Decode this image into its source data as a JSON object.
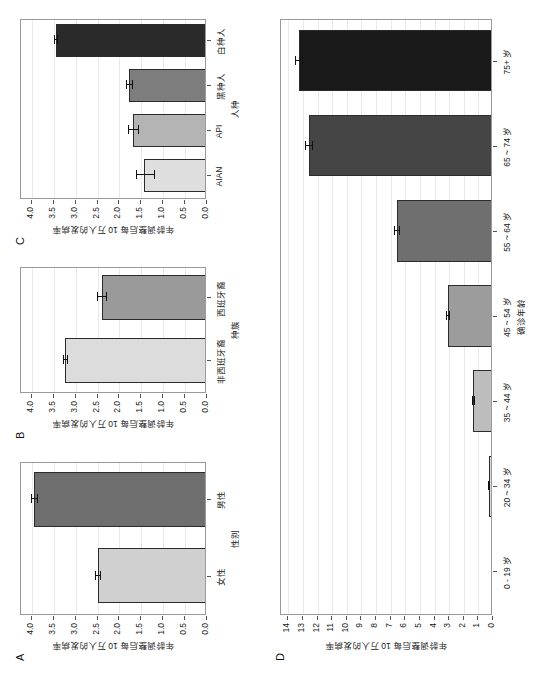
{
  "figure": {
    "axis_value_title": "年龄调整后每 10 万人的发病率",
    "panel_letters": {
      "a": "A",
      "b": "B",
      "c": "C",
      "d": "D"
    }
  },
  "chart_data": [
    {
      "id": "panel_a",
      "panel": "A",
      "type": "bar",
      "title": "",
      "xlabel": "性别",
      "ylabel": "年龄调整后每 10 万人的发病率",
      "categories": [
        "女性",
        "男性"
      ],
      "values": [
        2.5,
        3.95
      ],
      "err_low": [
        2.45,
        3.88
      ],
      "err_high": [
        2.56,
        4.02
      ],
      "bar_colors": [
        "#d0d0d0",
        "#6e6e6e"
      ],
      "yticks": [
        "0.0",
        "0.5",
        "1.0",
        "1.5",
        "2.0",
        "2.5",
        "3.0",
        "3.5",
        "4.0"
      ],
      "ylim": [
        0,
        4.25
      ],
      "grid": true
    },
    {
      "id": "panel_b",
      "panel": "B",
      "type": "bar",
      "title": "",
      "xlabel": "种族",
      "ylabel": "年龄调整后每 10 万人的发病率",
      "categories": [
        "非西班牙裔",
        "西班牙裔"
      ],
      "values": [
        3.25,
        2.4
      ],
      "err_low": [
        3.2,
        2.3
      ],
      "err_high": [
        3.3,
        2.52
      ],
      "bar_colors": [
        "#dcdcdc",
        "#9a9a9a"
      ],
      "yticks": [
        "0.0",
        "0.5",
        "1.0",
        "1.5",
        "2.0",
        "2.5",
        "3.0",
        "3.5",
        "4.0"
      ],
      "ylim": [
        0,
        4.25
      ],
      "grid": true
    },
    {
      "id": "panel_c",
      "panel": "C",
      "type": "bar",
      "title": "",
      "xlabel": "人种",
      "ylabel": "年龄调整后每 10 万人的发病率",
      "categories": [
        "AIAN",
        "API",
        "黑种人",
        "白种人"
      ],
      "values": [
        1.45,
        1.7,
        1.78,
        3.45
      ],
      "err_low": [
        1.2,
        1.58,
        1.72,
        3.42
      ],
      "err_high": [
        1.62,
        1.8,
        1.84,
        3.49
      ],
      "bar_colors": [
        "#dedede",
        "#b4b4b4",
        "#7d7d7d",
        "#2a2a2a"
      ],
      "yticks": [
        "0.0",
        "0.5",
        "1.0",
        "1.5",
        "2.0",
        "2.5",
        "3.0",
        "3.5",
        "4.0"
      ],
      "ylim": [
        0,
        4.25
      ],
      "grid": true
    },
    {
      "id": "panel_d",
      "panel": "D",
      "type": "bar",
      "title": "",
      "xlabel": "确诊年龄",
      "ylabel": "年龄调整后每 10 万人的发病率",
      "categories": [
        "0 - 19 岁",
        "20 ~ 34 岁",
        "35 ~ 44 岁",
        "45 ~ 54 岁",
        "55 ~ 64 岁",
        "65 ~ 74 岁",
        "75+ 岁"
      ],
      "values": [
        0.12,
        0.28,
        1.35,
        3.1,
        6.6,
        12.6,
        13.3
      ],
      "err_low": [
        0.1,
        0.25,
        1.3,
        3.0,
        6.45,
        12.35,
        13.05
      ],
      "err_high": [
        0.14,
        0.31,
        1.42,
        3.2,
        6.75,
        12.85,
        13.55
      ],
      "bar_colors": [
        "#efefef",
        "#d9d9d9",
        "#bdbdbd",
        "#9c9c9c",
        "#6f6f6f",
        "#454545",
        "#1a1a1a"
      ],
      "yticks": [
        "0",
        "1",
        "2",
        "3",
        "4",
        "5",
        "6",
        "7",
        "8",
        "9",
        "10",
        "11",
        "12",
        "13",
        "14"
      ],
      "ylim": [
        0,
        14.5
      ],
      "grid": true
    }
  ]
}
